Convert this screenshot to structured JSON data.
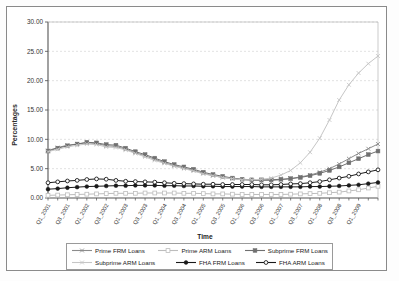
{
  "chart_data": {
    "type": "line",
    "title": "",
    "xlabel": "Time",
    "ylabel": "Percentages",
    "ylim": [
      0,
      30
    ],
    "yticks": [
      "0.00",
      "5.00",
      "10.00",
      "15.00",
      "20.00",
      "25.00",
      "30.00"
    ],
    "grid": true,
    "legend_position": "bottom",
    "categories": [
      "Q1_2001",
      "Q2_2001",
      "Q3_2001",
      "Q4_2001",
      "Q1_2002",
      "Q2_2002",
      "Q3_2002",
      "Q4_2002",
      "Q1_2003",
      "Q2_2003",
      "Q3_2003",
      "Q4_2003",
      "Q1_2004",
      "Q2_2004",
      "Q3_2004",
      "Q4_2004",
      "Q1_2005",
      "Q2_2005",
      "Q3_2005",
      "Q4_2005",
      "Q1_2006",
      "Q2_2006",
      "Q3_2006",
      "Q4_2006",
      "Q1_2007",
      "Q2_2007",
      "Q3_2007",
      "Q4_2007",
      "Q1_2008",
      "Q2_2008",
      "Q3_2008",
      "Q4_2008",
      "Q1_2009",
      "Q2_2009",
      "Q3_2009"
    ],
    "xtick_labels": [
      "Q1_2001",
      "Q3_2001",
      "Q1_2002",
      "Q3_2002",
      "Q1_2003",
      "Q3_2003",
      "Q1_2004",
      "Q3_2004",
      "Q1_2005",
      "Q3_2005",
      "Q1_2006",
      "Q3_2006",
      "Q1_2007",
      "Q3_2007",
      "Q1_2008",
      "Q3_2008",
      "Q1_2009"
    ],
    "series": [
      {
        "name": "Prime FRM Loans",
        "color": "#8c8c8c",
        "marker": "cross",
        "values": [
          8.1,
          8.6,
          9.0,
          9.2,
          9.4,
          9.3,
          8.9,
          8.8,
          8.3,
          7.7,
          7.2,
          6.6,
          6.0,
          5.5,
          5.1,
          4.7,
          4.2,
          3.8,
          3.5,
          3.3,
          3.1,
          3.0,
          3.0,
          3.0,
          3.1,
          3.3,
          3.6,
          3.9,
          4.4,
          5.0,
          5.8,
          6.7,
          7.6,
          8.4,
          9.2
        ]
      },
      {
        "name": "Prime ARM Loans",
        "color": "#bdbdbd",
        "marker": "open-square",
        "values": [
          0.45,
          0.5,
          0.55,
          0.6,
          0.65,
          0.7,
          0.75,
          0.8,
          0.8,
          0.8,
          0.85,
          0.85,
          0.85,
          0.85,
          0.8,
          0.8,
          0.75,
          0.7,
          0.7,
          0.65,
          0.6,
          0.6,
          0.6,
          0.6,
          0.6,
          0.65,
          0.7,
          0.75,
          0.8,
          0.9,
          1.0,
          1.2,
          1.4,
          1.7,
          2.0
        ]
      },
      {
        "name": "Subprime FRM Loans",
        "color": "#707070",
        "marker": "filled-square",
        "values": [
          8.0,
          8.5,
          8.9,
          9.2,
          9.5,
          9.4,
          9.1,
          9.0,
          8.5,
          7.9,
          7.4,
          6.8,
          6.2,
          5.7,
          5.3,
          4.9,
          4.4,
          4.0,
          3.7,
          3.4,
          3.2,
          3.1,
          3.1,
          3.1,
          3.2,
          3.3,
          3.5,
          3.8,
          4.2,
          4.7,
          5.3,
          6.0,
          6.7,
          7.4,
          8.0
        ]
      },
      {
        "name": "Subprime ARM Loans",
        "color": "#c6c6c6",
        "marker": "cross",
        "values": [
          7.9,
          8.3,
          8.7,
          9.0,
          9.2,
          9.1,
          8.7,
          8.6,
          8.2,
          7.6,
          7.0,
          6.4,
          5.9,
          5.4,
          5.0,
          4.6,
          4.1,
          3.8,
          3.5,
          3.3,
          3.1,
          3.1,
          3.2,
          3.4,
          3.9,
          4.7,
          6.0,
          7.8,
          10.2,
          13.3,
          16.7,
          19.3,
          21.3,
          22.9,
          24.2
        ]
      },
      {
        "name": "FHA FRM Loans",
        "color": "#1a1a1a",
        "marker": "filled-circle",
        "values": [
          1.5,
          1.6,
          1.75,
          1.85,
          1.95,
          2.0,
          2.05,
          2.1,
          2.1,
          2.15,
          2.15,
          2.15,
          2.1,
          2.1,
          2.05,
          2.05,
          2.0,
          2.0,
          1.95,
          1.95,
          1.95,
          1.95,
          1.9,
          1.9,
          1.9,
          1.9,
          1.9,
          1.95,
          1.95,
          2.0,
          2.05,
          2.15,
          2.25,
          2.45,
          2.65
        ]
      },
      {
        "name": "FHA ARM Loans",
        "color": "#1a1a1a",
        "marker": "open-circle",
        "values": [
          2.6,
          2.75,
          2.9,
          3.0,
          3.15,
          3.25,
          3.2,
          3.0,
          2.85,
          2.8,
          2.75,
          2.7,
          2.6,
          2.5,
          2.45,
          2.4,
          2.35,
          2.35,
          2.3,
          2.3,
          2.3,
          2.3,
          2.25,
          2.25,
          2.3,
          2.4,
          2.45,
          2.6,
          2.8,
          3.1,
          3.4,
          3.7,
          4.1,
          4.45,
          4.8
        ]
      }
    ]
  },
  "legend": {
    "items": [
      {
        "label": "Prime FRM Loans"
      },
      {
        "label": "Prime ARM Loans"
      },
      {
        "label": "Subprime FRM Loans"
      },
      {
        "label": "Subprime ARM Loans"
      },
      {
        "label": "FHA FRM Loans"
      },
      {
        "label": "FHA ARM Loans"
      }
    ]
  }
}
